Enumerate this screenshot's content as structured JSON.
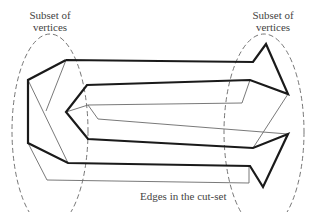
{
  "diagram": {
    "labels": {
      "left_subset": [
        "Subset of",
        "vertices"
      ],
      "right_subset": [
        "Subset of",
        "vertices"
      ],
      "cut_set": "Edges in the cut-set"
    },
    "colors": {
      "thick_edge": "#1a1a1a",
      "thin_edge": "#6a6a6a",
      "dashed_boundary": "#666666",
      "text": "#444444"
    },
    "regions": [
      {
        "name": "left-subset",
        "shape": "dashed-ellipse",
        "cx": 50,
        "cy": 131,
        "rx": 38,
        "ry": 97
      },
      {
        "name": "right-subset",
        "shape": "dashed-ellipse",
        "cx": 264,
        "cy": 132,
        "rx": 40,
        "ry": 98
      }
    ],
    "edges": {
      "thick": [
        "66,60 253,62 266,44 288,94 250,80 87,85 66,112 88,139 253,148 288,134 263,187 250,166 68,163 28,143 28,80 66,60"
      ],
      "thin": [
        "66,60 46,111",
        "28,80 68,163",
        "28,143 47,180 249,183 249,166",
        "66,112 88,105 98,119 288,134",
        "88,105 242,103 250,80",
        "288,94 253,148"
      ]
    }
  }
}
